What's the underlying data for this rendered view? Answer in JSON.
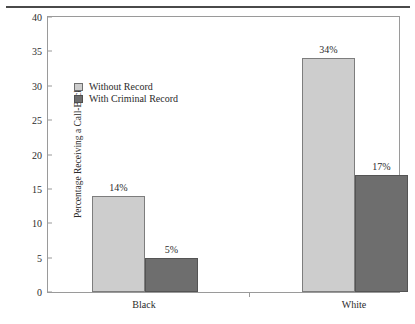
{
  "figure": {
    "caption_fragment": "",
    "rule": "horizontal-rule"
  },
  "chart_data": {
    "type": "bar",
    "title": "",
    "xlabel": "",
    "ylabel": "Percentage Receiving a Call-Back",
    "categories": [
      "Black",
      "White"
    ],
    "series": [
      {
        "name": "Without Record",
        "values": [
          14,
          34
        ],
        "color": "#cdcdcd"
      },
      {
        "name": "With Criminal Record",
        "values": [
          5,
          17
        ],
        "color": "#6e6e6e"
      }
    ],
    "data_labels": [
      [
        "14%",
        "34%"
      ],
      [
        "5%",
        "17%"
      ]
    ],
    "ylim": [
      0,
      40
    ],
    "yticks": [
      0,
      5,
      10,
      15,
      20,
      25,
      30,
      35,
      40
    ],
    "ytick_labels": [
      "0",
      "5",
      "10",
      "15",
      "20",
      "25",
      "30",
      "35",
      "40"
    ],
    "grid": false,
    "legend_position": "inside-upper-left",
    "frame": true
  }
}
